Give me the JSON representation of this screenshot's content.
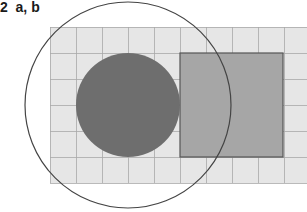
{
  "figure": {
    "label_number": "2",
    "label_parts": "a, b",
    "grid": {
      "x0": 50,
      "y0": 27,
      "cell": 26,
      "cols": 10,
      "rows": 6,
      "fill": "#e6e6e6",
      "line": "#a8a8a8"
    },
    "rectangle": {
      "x": 180,
      "y": 53,
      "width": 103,
      "height": 104,
      "fill": "#a6a6a6",
      "stroke": "#555555"
    },
    "small_circle": {
      "cx": 128,
      "cy": 105,
      "r": 52,
      "fill": "#6e6e6e"
    },
    "large_circle": {
      "cx": 128,
      "cy": 105,
      "r": 103,
      "stroke": "#444444"
    }
  }
}
